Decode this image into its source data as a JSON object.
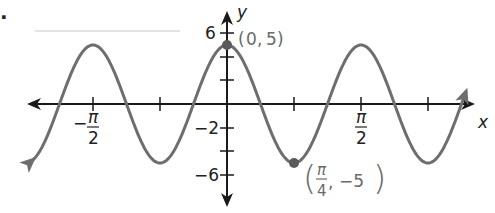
{
  "figure": {
    "bullet": ".",
    "colors": {
      "axis": "#1a1a1a",
      "curve": "#6e6e6e",
      "point": "#5a5a5a",
      "point_label": "#6a6a6a"
    }
  },
  "chart_data": {
    "type": "line",
    "title": "",
    "function": "y = 5 cos(4x)",
    "xlabel": "x",
    "ylabel": "y",
    "xlim": [
      -1.73,
      1.85
    ],
    "ylim": [
      -7,
      7.5
    ],
    "grid": false,
    "legend": null,
    "x_ticks": [
      {
        "value": -1.5708,
        "label_num": "π",
        "label_den": "2",
        "label_sign": "−",
        "label": "-π/2"
      },
      {
        "value": -0.7854,
        "label": ""
      },
      {
        "value": 0,
        "label": ""
      },
      {
        "value": 0.7854,
        "label": ""
      },
      {
        "value": 1.5708,
        "label_num": "π",
        "label_den": "2",
        "label_sign": "",
        "label": "π/2"
      },
      {
        "value": 2.3562,
        "label": ""
      }
    ],
    "y_ticks": [
      {
        "value": 6,
        "label": "6"
      },
      {
        "value": 4,
        "label": ""
      },
      {
        "value": 2,
        "label": ""
      },
      {
        "value": -2,
        "label": "−2"
      },
      {
        "value": -4,
        "label": ""
      },
      {
        "value": -6,
        "label": "−6"
      }
    ],
    "series": [
      {
        "name": "5cos(4x)",
        "amplitude": 5,
        "period": 1.5708,
        "x": [
          -1.5708,
          -1.1781,
          -0.7854,
          -0.3927,
          0,
          0.3927,
          0.7854,
          1.1781,
          1.5708,
          1.9635
        ],
        "y": [
          5,
          0,
          -5,
          0,
          5,
          0,
          -5,
          0,
          5,
          0
        ]
      }
    ],
    "annotations": [
      {
        "x": 0,
        "y": 5,
        "label": "(0, 5)",
        "x_text": "0",
        "y_text": "5"
      },
      {
        "x": 0.7854,
        "y": -5,
        "label": "(π/4, −5)",
        "x_num": "π",
        "x_den": "4",
        "y_text": "−5"
      }
    ]
  }
}
